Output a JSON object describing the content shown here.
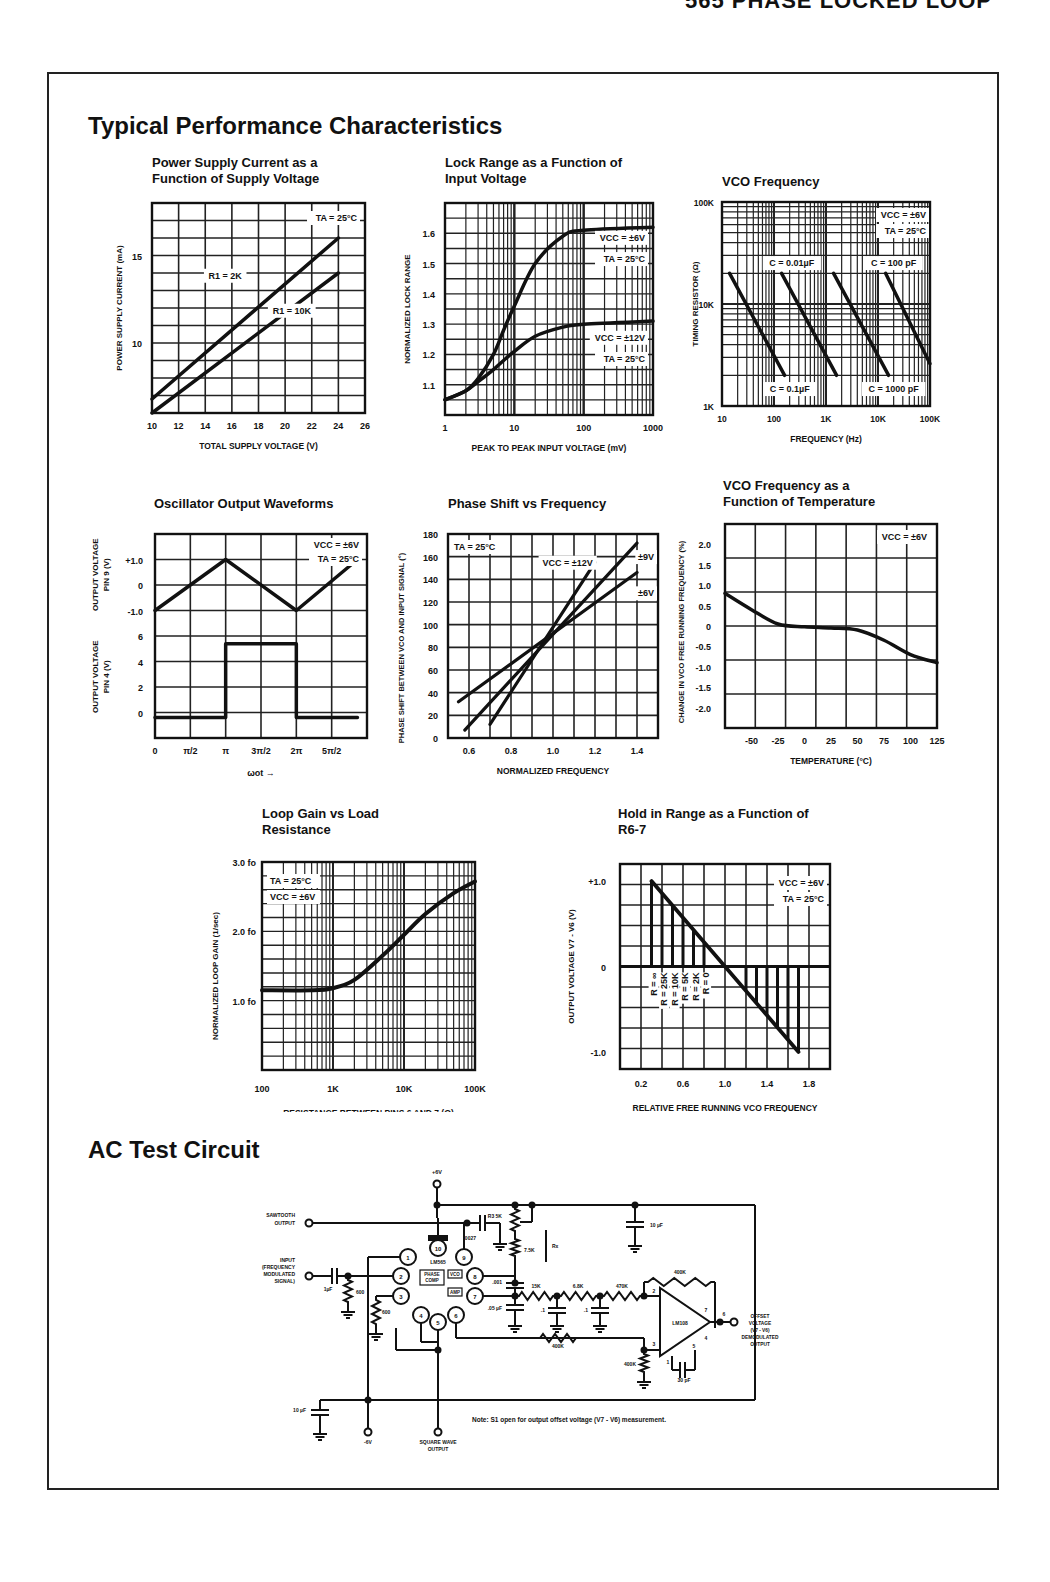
{
  "page": {
    "header": "565 PHASE LOCKED LOOP",
    "section_title_1": "Typical Performance Characteristics",
    "section_title_2": "AC Test Circuit"
  },
  "chart_data": [
    {
      "id": "power-supply-current",
      "type": "line",
      "title": "Power Supply Current as a Function of Supply Voltage",
      "xlabel": "TOTAL SUPPLY VOLTAGE (V)",
      "ylabel": "POWER SUPPLY CURRENT (mA)",
      "xlim": [
        10,
        26
      ],
      "ylim": [
        6,
        18
      ],
      "x_ticks": [
        "10",
        "12",
        "14",
        "16",
        "18",
        "20",
        "22",
        "24",
        "26"
      ],
      "y_ticks": [
        "10",
        "15"
      ],
      "grid": true,
      "annotations": [
        "TA = 25°C"
      ],
      "series": [
        {
          "name": "R1 = 2K",
          "x": [
            10,
            24
          ],
          "y": [
            6.8,
            16.0
          ]
        },
        {
          "name": "R1 = 10K",
          "x": [
            10,
            24
          ],
          "y": [
            6.0,
            14.0
          ]
        }
      ]
    },
    {
      "id": "lock-range",
      "type": "line",
      "title": "Lock Range as a Function of Input Voltage",
      "xlabel": "PEAK TO PEAK INPUT VOLTAGE (mV)",
      "ylabel": "NORMALIZED LOCK RANGE",
      "xscale": "log",
      "xlim": [
        1,
        1000
      ],
      "ylim": [
        1.0,
        1.7
      ],
      "x_ticks": [
        "1",
        "10",
        "100",
        "1000"
      ],
      "y_ticks": [
        "1.1",
        "1.2",
        "1.3",
        "1.4",
        "1.5",
        "1.6"
      ],
      "grid": true,
      "series": [
        {
          "name": "VCC = ±6V, TA = 25°C",
          "x": [
            1,
            2,
            3,
            5,
            7,
            10,
            20,
            50,
            100,
            1000
          ],
          "y": [
            1.05,
            1.08,
            1.12,
            1.2,
            1.28,
            1.36,
            1.5,
            1.59,
            1.61,
            1.62
          ]
        },
        {
          "name": "VCC = ±12V, TA = 25°C",
          "x": [
            1,
            2,
            3,
            5,
            7,
            10,
            20,
            50,
            100,
            1000
          ],
          "y": [
            1.05,
            1.08,
            1.11,
            1.15,
            1.18,
            1.21,
            1.26,
            1.29,
            1.3,
            1.31
          ]
        }
      ]
    },
    {
      "id": "vco-frequency",
      "type": "line",
      "title": "VCO Frequency",
      "xlabel": "FREQUENCY (Hz)",
      "ylabel": "TIMING RESISTOR (Ω)",
      "xscale": "log",
      "yscale": "log",
      "xlim": [
        10,
        100000
      ],
      "ylim": [
        1000,
        100000
      ],
      "x_ticks": [
        "10",
        "100",
        "1K",
        "10K",
        "100K"
      ],
      "y_ticks": [
        "1K",
        "10K",
        "100K"
      ],
      "grid": true,
      "annotations": [
        "VCC = ±6V",
        "TA = 25°C"
      ],
      "series": [
        {
          "name": "C = 0.1µF",
          "x": [
            14,
            160
          ],
          "y": [
            20000,
            2000
          ]
        },
        {
          "name": "C = 0.01µF",
          "x": [
            140,
            1600
          ],
          "y": [
            20000,
            2000
          ]
        },
        {
          "name": "C = 1000 pF",
          "x": [
            1400,
            16000
          ],
          "y": [
            20000,
            2000
          ]
        },
        {
          "name": "C = 100 pF",
          "x": [
            14000,
            100000
          ],
          "y": [
            20000,
            2600
          ]
        }
      ]
    },
    {
      "id": "oscillator-waveforms",
      "type": "line",
      "title": "Oscillator Output Waveforms",
      "xlabel": "ωot →",
      "ylabel_top": "OUTPUT VOLTAGE PIN 9 (V)",
      "ylabel_bottom": "OUTPUT VOLTAGE PIN 4 (V)",
      "x_ticks": [
        "0",
        "π/2",
        "π",
        "3π/2",
        "2π",
        "5π/2"
      ],
      "y_ticks_top": [
        "+1.0",
        "0",
        "-1.0"
      ],
      "y_ticks_bottom": [
        "6",
        "4",
        "2",
        "0"
      ],
      "grid": true,
      "annotations": [
        "VCC = ±6V",
        "TA = 25°C"
      ],
      "series": [
        {
          "name": "Pin 9 triangle",
          "x": [
            0,
            3.1416,
            6.2832,
            9.0
          ],
          "y": [
            -1.0,
            1.0,
            -1.0,
            1.0
          ]
        },
        {
          "name": "Pin 4 square",
          "x": [
            0,
            3.1416,
            3.1416,
            6.2832,
            6.2832,
            9.0
          ],
          "y": [
            -0.4,
            -0.4,
            5.4,
            5.4,
            -0.4,
            -0.4
          ]
        }
      ]
    },
    {
      "id": "phase-shift",
      "type": "line",
      "title": "Phase Shift vs Frequency",
      "xlabel": "NORMALIZED FREQUENCY",
      "ylabel": "PHASE SHIFT BETWEEN VCO AND INPUT SIGNAL (°)",
      "xlim": [
        0.5,
        1.5
      ],
      "ylim": [
        0,
        180
      ],
      "x_ticks": [
        "0.6",
        "0.8",
        "1.0",
        "1.2",
        "1.4"
      ],
      "y_ticks": [
        "0",
        "20",
        "40",
        "60",
        "80",
        "100",
        "120",
        "140",
        "160",
        "180"
      ],
      "grid": true,
      "annotations": [
        "TA = 25°C"
      ],
      "series": [
        {
          "name": "VCC = ±12V",
          "x": [
            0.7,
            1.2
          ],
          "y": [
            12,
            155
          ]
        },
        {
          "name": "±9V",
          "x": [
            0.58,
            1.4
          ],
          "y": [
            7,
            172
          ]
        },
        {
          "name": "±6V",
          "x": [
            0.55,
            1.4
          ],
          "y": [
            32,
            146
          ]
        }
      ]
    },
    {
      "id": "vco-temperature",
      "type": "line",
      "title": "VCO Frequency as a Function of Temperature",
      "xlabel": "TEMPERATURE (°C)",
      "ylabel": "CHANGE IN VCO FREE RUNNING FREQUENCY (%)",
      "xlim": [
        -75,
        125
      ],
      "ylim": [
        -2.5,
        2.5
      ],
      "x_ticks": [
        "-50",
        "-25",
        "0",
        "25",
        "50",
        "75",
        "100",
        "125"
      ],
      "y_ticks": [
        "2.0",
        "1.5",
        "1.0",
        "0.5",
        "0",
        "-0.5",
        "-1.0",
        "-1.5",
        "-2.0"
      ],
      "grid": true,
      "annotations": [
        "VCC = ±6V"
      ],
      "series": [
        {
          "name": "VCC = ±6V",
          "x": [
            -75,
            -50,
            -25,
            0,
            25,
            50,
            75,
            100,
            125
          ],
          "y": [
            0.8,
            0.4,
            0.05,
            -0.02,
            -0.05,
            -0.1,
            -0.35,
            -0.7,
            -0.9
          ]
        }
      ]
    },
    {
      "id": "loop-gain",
      "type": "line",
      "title": "Loop Gain vs Load Resistance",
      "xlabel": "RESISTANCE BETWEEN PINS 6 AND 7 (Ω)",
      "ylabel": "NORMALIZED LOOP GAIN (1/sec)",
      "xscale": "log",
      "xlim": [
        100,
        100000
      ],
      "ylim": [
        0,
        3.0
      ],
      "x_ticks": [
        "100",
        "1K",
        "10K",
        "100K"
      ],
      "y_ticks": [
        "1.0 fo",
        "2.0 fo",
        "3.0 fo"
      ],
      "grid": true,
      "annotations": [
        "TA = 25°C",
        "VCC = ±6V"
      ],
      "series": [
        {
          "name": "TA = 25°C, VCC = ±6V",
          "x": [
            100,
            500,
            1000,
            2000,
            5000,
            10000,
            20000,
            50000,
            100000
          ],
          "y": [
            1.15,
            1.15,
            1.18,
            1.3,
            1.65,
            1.95,
            2.25,
            2.55,
            2.72
          ]
        }
      ]
    },
    {
      "id": "hold-in-range",
      "type": "line",
      "title": "Hold in Range as a Function of R6-7",
      "xlabel": "RELATIVE FREE RUNNING VCO FREQUENCY",
      "ylabel": "OUTPUT VOLTAGE V7 - V6 (V)",
      "xlim": [
        0,
        2.0
      ],
      "ylim": [
        -1.2,
        1.2
      ],
      "x_ticks": [
        "0.2",
        "0.6",
        "1.0",
        "1.4",
        "1.8"
      ],
      "y_ticks": [
        "+1.0",
        "0",
        "-1.0"
      ],
      "grid": true,
      "annotations": [
        "VCC = ±6V",
        "TA = 25°C"
      ],
      "r_labels": [
        "R = ∞",
        "R = 25K",
        "R = 10K",
        "R = 5K",
        "R = 2K",
        "R = 0"
      ],
      "series": [
        {
          "name": "transfer",
          "x": [
            0.3,
            1.7
          ],
          "y": [
            1.0,
            -1.0
          ]
        }
      ]
    }
  ],
  "circuit": {
    "labels": {
      "vplus": "+6V",
      "vminus": "-6V",
      "sawtooth": "SAWTOOTH OUTPUT",
      "input": "INPUT (FREQUENCY MODULATED SIGNAL)",
      "square": "SQUARE WAVE OUTPUT",
      "offset": "OFFSET VOLTAGE (V7 - V6) DEMODULATED OUTPUT",
      "ic": "LM565",
      "opamp": "LM108",
      "phase_comp": "PHASE COMP",
      "vco": "VCO",
      "amp": "AMP",
      "r3": "R3 5K",
      "r75k": "7.5K",
      "c0027": ".0027",
      "c10u_top": "10 µF",
      "c10u_bot": "10 µF",
      "c1u": "1µF",
      "r600a": "600",
      "r600b": "600",
      "c001": ".001",
      "c05u": ".05 µF",
      "r15k": "15K",
      "r68k": "6.8K",
      "r470k": "470K",
      "c1a": ".1",
      "c1b": ".1",
      "r400k_fb": "400K",
      "r400k_in": "400K",
      "r400k_gnd": "400K",
      "c30p": "30 pF",
      "rx": "Rx"
    },
    "pins": [
      "1",
      "2",
      "3",
      "4",
      "5",
      "6",
      "7",
      "8",
      "9",
      "10"
    ],
    "note": "Note: S1 open for output offset voltage (V7 - V6) measurement."
  }
}
